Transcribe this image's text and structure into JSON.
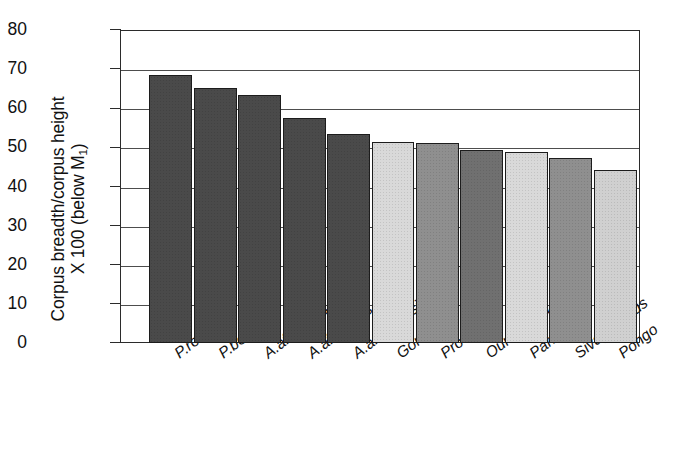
{
  "chart_data": {
    "type": "bar",
    "title": "",
    "subtitle": "",
    "xlabel": "",
    "ylabel_line1": "Corpus breadth/corpus height",
    "ylabel_line2_prefix": "X 100 (below M",
    "ylabel_line2_sub": "1",
    "ylabel_line2_suffix": ")",
    "categories": [
      "P.robustus",
      "P.boisei",
      "A.africanus",
      "A.afarensis",
      "A.anamensis",
      "Gorilla",
      "Proconsul",
      "Ouranopith.",
      "Pan",
      "Sivapithecus",
      "Pongo"
    ],
    "values": [
      68.5,
      65.2,
      63.5,
      57.5,
      53.5,
      51.5,
      51.0,
      49.3,
      48.8,
      47.4,
      44.1
    ],
    "bar_colors": [
      "#4a4a4a",
      "#4a4a4a",
      "#4a4a4a",
      "#4a4a4a",
      "#4a4a4a",
      "#d9d9d9",
      "#8f8f8f",
      "#707070",
      "#d9d9d9",
      "#8f8f8f",
      "#d0d0d0"
    ],
    "ylim": [
      0,
      80
    ],
    "yticks": [
      0,
      10,
      20,
      30,
      40,
      50,
      60,
      70,
      80
    ],
    "ytick_labels": [
      "0",
      "10",
      "20",
      "30",
      "40",
      "50",
      "60",
      "70",
      "80"
    ],
    "grid": true,
    "grid_axis": "y",
    "legend": false,
    "legend_position": "none",
    "axis_color": "#2b2b2b",
    "grid_color": "#4d4d4d",
    "background": "#ffffff"
  }
}
